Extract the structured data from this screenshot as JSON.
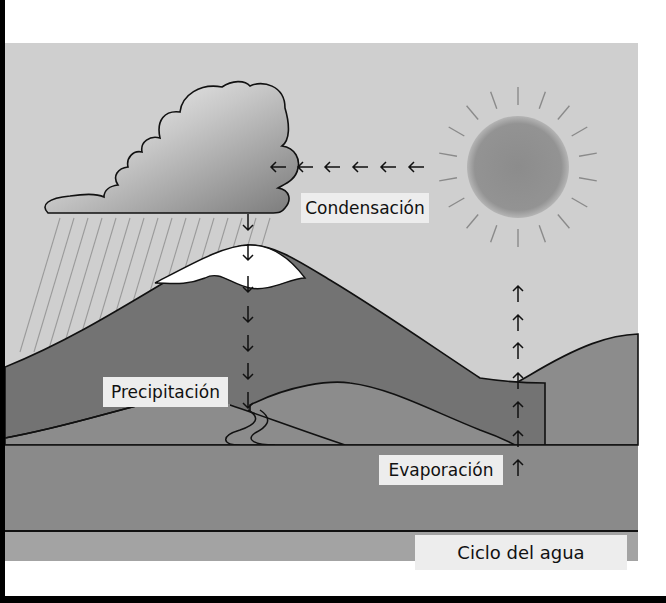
{
  "diagram": {
    "title": "Ciclo del agua",
    "labels": {
      "condensation": "Condensación",
      "precipitation": "Precipitación",
      "evaporation": "Evaporación"
    },
    "elements": {
      "cloud": "rain-cloud",
      "sun": "sun",
      "mountain": "snow-capped-mountain",
      "hills": "rolling-hills",
      "river": "river",
      "lake": "lake"
    },
    "arrows": {
      "condensation_direction": "left",
      "condensation_count": 6,
      "precipitation_direction": "down",
      "precipitation_count": 7,
      "evaporation_direction": "up",
      "evaporation_count": 7
    },
    "colors": {
      "sky": "#cfcfcf",
      "mountain": "#737373",
      "hill": "#8c8c8c",
      "ground": "#8a8a8a",
      "lake": "#9a9a9a",
      "sun": "#8f8f8f",
      "snow": "#ffffff",
      "label_bg": "#ededed"
    }
  }
}
